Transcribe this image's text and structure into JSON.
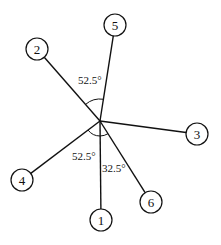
{
  "diagram": {
    "center": {
      "x": 100,
      "y": 121
    },
    "node_radius": 11,
    "colors": {
      "stroke": "#111111",
      "background": "#ffffff"
    },
    "nodes": [
      {
        "id": "1",
        "label": "1",
        "x": 101,
        "y": 220
      },
      {
        "id": "2",
        "label": "2",
        "x": 37,
        "y": 49
      },
      {
        "id": "3",
        "label": "3",
        "x": 197,
        "y": 134
      },
      {
        "id": "4",
        "label": "4",
        "x": 22,
        "y": 180
      },
      {
        "id": "5",
        "label": "5",
        "x": 115,
        "y": 25
      },
      {
        "id": "6",
        "label": "6",
        "x": 151,
        "y": 202
      }
    ],
    "angles": [
      {
        "label": "52.5°",
        "between": [
          "2",
          "5"
        ],
        "x": 78,
        "y": 84
      },
      {
        "label": "52.5°",
        "between": [
          "4",
          "1"
        ],
        "x": 72,
        "y": 160
      },
      {
        "label": "32.5°",
        "between": [
          "1",
          "6"
        ],
        "x": 102,
        "y": 172
      }
    ]
  }
}
